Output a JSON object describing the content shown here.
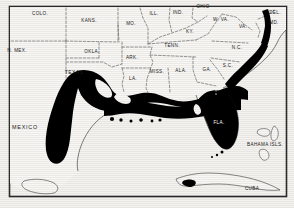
{
  "figure": {
    "kind": "distribution-range-map",
    "frame_color": "#222222",
    "land_color": "#f7f6f3",
    "range_color": "#000000",
    "border_style": "dashed state boundaries"
  },
  "state_labels": [
    {
      "name": "colorado",
      "text": "COLO.",
      "x": 40,
      "y": 14,
      "size": "s-lbl"
    },
    {
      "name": "kansas",
      "text": "KANS.",
      "x": 89,
      "y": 21,
      "size": "s-lbl"
    },
    {
      "name": "missouri",
      "text": "MO.",
      "x": 131,
      "y": 24,
      "size": "s-lbl"
    },
    {
      "name": "illinois",
      "text": "ILL.",
      "x": 154,
      "y": 14,
      "size": "s-lbl"
    },
    {
      "name": "indiana",
      "text": "IND.",
      "x": 178,
      "y": 13,
      "size": "s-lbl"
    },
    {
      "name": "ohio",
      "text": "OHIO",
      "x": 203,
      "y": 7,
      "size": "s-lbl"
    },
    {
      "name": "west-virginia",
      "text": "W. VA.",
      "x": 221,
      "y": 20,
      "size": "s-lbl"
    },
    {
      "name": "virginia",
      "text": "VA.",
      "x": 243,
      "y": 27,
      "size": "s-lbl"
    },
    {
      "name": "delaware",
      "text": "DEL.",
      "x": 275,
      "y": 13,
      "size": "s-lbl"
    },
    {
      "name": "maryland",
      "text": "MD.",
      "x": 274,
      "y": 23,
      "size": "s-lbl"
    },
    {
      "name": "new-mexico",
      "text": "N. MEX.",
      "x": 17,
      "y": 51,
      "size": "s-lbl"
    },
    {
      "name": "oklahoma",
      "text": "OKLA.",
      "x": 92,
      "y": 52,
      "size": "s-lbl"
    },
    {
      "name": "arkansas",
      "text": "ARK.",
      "x": 132,
      "y": 58,
      "size": "s-lbl"
    },
    {
      "name": "tennessee",
      "text": "TENN.",
      "x": 172,
      "y": 46,
      "size": "s-lbl"
    },
    {
      "name": "kentucky",
      "text": "KY.",
      "x": 190,
      "y": 32,
      "size": "s-lbl"
    },
    {
      "name": "north-carolina",
      "text": "N.C.",
      "x": 237,
      "y": 48,
      "size": "s-lbl"
    },
    {
      "name": "south-carolina",
      "text": "S.C.",
      "x": 228,
      "y": 66,
      "size": "s-lbl"
    },
    {
      "name": "georgia",
      "text": "GA.",
      "x": 207,
      "y": 70,
      "size": "s-lbl"
    },
    {
      "name": "alabama",
      "text": "ALA.",
      "x": 181,
      "y": 71,
      "size": "s-lbl"
    },
    {
      "name": "mississippi",
      "text": "MISS.",
      "x": 157,
      "y": 72,
      "size": "s-lbl"
    },
    {
      "name": "louisiana",
      "text": "LA.",
      "x": 133,
      "y": 79,
      "size": "s-lbl"
    },
    {
      "name": "texas",
      "text": "TEXAS",
      "x": 74,
      "y": 73,
      "size": "c-lbl"
    }
  ],
  "region_labels": [
    {
      "name": "mexico",
      "text": "MEXICO",
      "x": 25,
      "y": 128,
      "size": "r-lbl",
      "white": false
    },
    {
      "name": "bahama-islands",
      "text": "BAHAMA ISLS.",
      "x": 265,
      "y": 145,
      "size": "s-lbl",
      "white": false
    },
    {
      "name": "cuba",
      "text": "CUBA",
      "x": 252,
      "y": 189,
      "size": "s-lbl",
      "white": false
    },
    {
      "name": "florida",
      "text": "FLA.",
      "x": 219,
      "y": 123,
      "size": "s-lbl",
      "white": true
    }
  ]
}
